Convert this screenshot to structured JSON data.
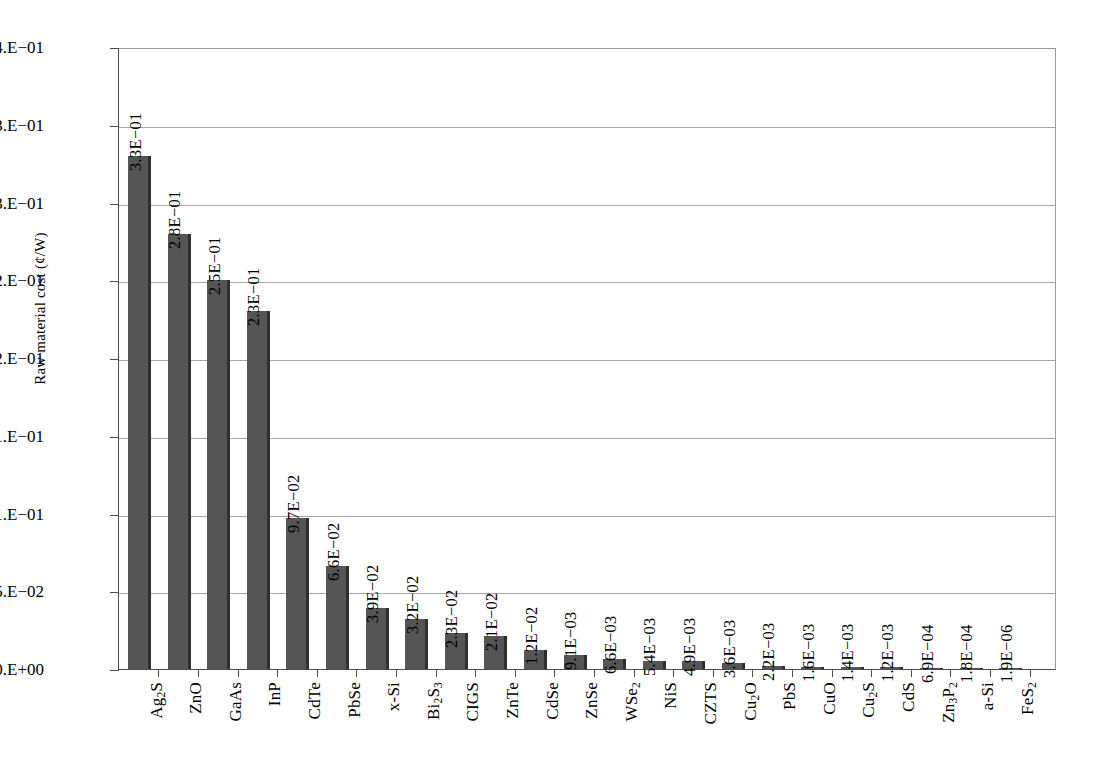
{
  "chart_data": {
    "type": "bar",
    "title": "",
    "xlabel": "",
    "ylabel": "Raw material cost (¢/W)",
    "ylim": [
      0,
      0.4
    ],
    "grid": true,
    "legend": "none",
    "y_tick_values": [
      0.4,
      0.35,
      0.3,
      0.25,
      0.2,
      0.15,
      0.1,
      0.05,
      0
    ],
    "y_tick_labels": [
      "4.E−01",
      "3.E−01",
      "3.E−01",
      "2.E−01",
      "2.E−01",
      "1.E−01",
      "1.E−01",
      "5.E−02",
      "0.E+00"
    ],
    "categories": [
      "Ag2S",
      "ZnO",
      "GaAs",
      "InP",
      "CdTe",
      "PbSe",
      "x-Si",
      "Bi2S3",
      "CIGS",
      "ZnTe",
      "CdSe",
      "ZnSe",
      "WSe2",
      "NiS",
      "CZTS",
      "Cu2O",
      "PbS",
      "CuO",
      "Cu2S",
      "CdS",
      "Zn3P2",
      "a-Si",
      "FeS2"
    ],
    "category_labels_html": [
      "Ag<sub>2</sub>S",
      "ZnO",
      "GaAs",
      "InP",
      "CdTe",
      "PbSe",
      "x-Si",
      "Bi<sub>2</sub>S<sub>3</sub>",
      "CIGS",
      "ZnTe",
      "CdSe",
      "ZnSe",
      "WSe<sub>2</sub>",
      "NiS",
      "CZTS",
      "Cu<sub>2</sub>O",
      "PbS",
      "CuO",
      "Cu<sub>2</sub>S",
      "CdS",
      "Zn<sub>3</sub>P<sub>2</sub>",
      "a-Si",
      "FeS<sub>2</sub>"
    ],
    "values": [
      0.33,
      0.28,
      0.25,
      0.23,
      0.097,
      0.066,
      0.039,
      0.032,
      0.023,
      0.021,
      0.012,
      0.0091,
      0.0066,
      0.0054,
      0.0049,
      0.0036,
      0.0022,
      0.0016,
      0.0014,
      0.0012,
      0.00069,
      0.00018,
      1.9e-06
    ],
    "value_labels": [
      "3.3E−01",
      "2.8E−01",
      "2.5E−01",
      "2.3E−01",
      "9.7E−02",
      "6.6E−02",
      "3.9E−02",
      "3.2E−02",
      "2.3E−02",
      "2.1E−02",
      "1.2E−02",
      "9.1E−03",
      "6.6E−03",
      "5.4E−03",
      "4.9E−03",
      "3.6E−03",
      "2.2E−03",
      "1.6E−03",
      "1.4E−03",
      "1.2E−03",
      "6.9E−04",
      "1.8E−04",
      "1.9E−06"
    ],
    "bar_color": "#555555",
    "bar_edge_color": "#2f2f2f",
    "gridline_color": "#a8a8a8",
    "axis_color": "#4d4d4d"
  }
}
